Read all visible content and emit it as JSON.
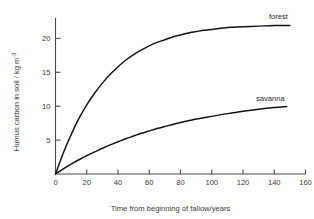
{
  "chart_data": {
    "type": "line",
    "title": "",
    "xlabel": "Time from beginning of fallow/years",
    "ylabel": "Humus carbon in soil / kg m",
    "ylabel_exponent": "-3",
    "xlim": [
      0,
      160
    ],
    "ylim": [
      0,
      23
    ],
    "xticks": [
      0,
      20,
      40,
      60,
      80,
      100,
      120,
      140,
      160
    ],
    "xtick_labels": [
      "0",
      "20",
      "40",
      "60",
      "80",
      "100",
      "120",
      "140",
      "160"
    ],
    "yticks": [
      5,
      10,
      15,
      20
    ],
    "ytick_labels": [
      "5",
      "10",
      "15",
      "20"
    ],
    "grid": false,
    "legend_position": "inline-end-of-curve",
    "series": [
      {
        "name": "forest",
        "label": "forest",
        "color": "#111111",
        "plateau": 22,
        "x": [
          0,
          5,
          10,
          15,
          20,
          25,
          30,
          35,
          40,
          45,
          50,
          55,
          60,
          65,
          70,
          75,
          80,
          85,
          90,
          95,
          100,
          110,
          120,
          130,
          140,
          150
        ],
        "y": [
          0.0,
          3.1,
          5.8,
          8.2,
          10.2,
          11.9,
          13.4,
          14.7,
          15.8,
          16.8,
          17.6,
          18.3,
          18.9,
          19.4,
          19.8,
          20.2,
          20.5,
          20.8,
          21.0,
          21.2,
          21.3,
          21.6,
          21.7,
          21.8,
          21.9,
          21.9
        ]
      },
      {
        "name": "savanna",
        "label": "savanna",
        "color": "#111111",
        "plateau": 10,
        "x": [
          0,
          5,
          10,
          15,
          20,
          25,
          30,
          35,
          40,
          45,
          50,
          55,
          60,
          65,
          70,
          75,
          80,
          85,
          90,
          95,
          100,
          110,
          120,
          130,
          140,
          148
        ],
        "y": [
          0.0,
          0.75,
          1.45,
          2.1,
          2.7,
          3.25,
          3.8,
          4.3,
          4.75,
          5.2,
          5.6,
          6.0,
          6.35,
          6.7,
          7.0,
          7.3,
          7.6,
          7.85,
          8.1,
          8.3,
          8.5,
          8.9,
          9.25,
          9.55,
          9.8,
          9.95
        ]
      }
    ]
  },
  "colors": {
    "background": "#ffffff",
    "axis": "#4a4a4a",
    "curve": "#111111",
    "text": "#3a3a3a"
  }
}
